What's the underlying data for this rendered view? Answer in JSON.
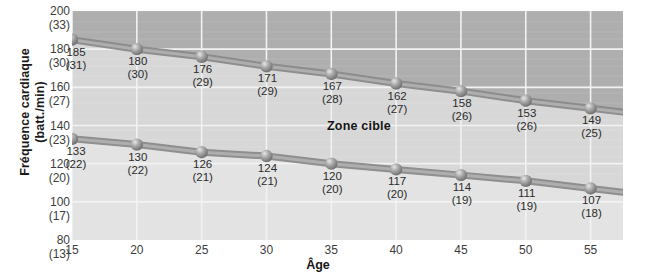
{
  "chart_data": {
    "type": "line",
    "title": "",
    "xlabel": "Âge",
    "ylabel_line1": "Fréquence cardiaque",
    "ylabel_line2": "(batt./min)",
    "x": [
      15,
      20,
      25,
      30,
      35,
      40,
      45,
      50,
      55
    ],
    "xtick_labels": [
      "15",
      "20",
      "25",
      "30",
      "35",
      "40",
      "45",
      "50",
      "55"
    ],
    "xlim": [
      15,
      57.5
    ],
    "ylim": [
      80,
      200
    ],
    "grid": true,
    "legend_position": "none",
    "ytick_values": [
      200,
      180,
      160,
      140,
      120,
      100,
      80
    ],
    "ytick_labels": [
      {
        "main": "200",
        "paren": "(33)"
      },
      {
        "main": "180",
        "paren": "(30)"
      },
      {
        "main": "160",
        "paren": "(27)"
      },
      {
        "main": "140",
        "paren": "(23)"
      },
      {
        "main": "120",
        "paren": "(20)"
      },
      {
        "main": "100",
        "paren": "(17)"
      },
      {
        "main": "80",
        "paren": "(13)"
      }
    ],
    "annotations": [
      {
        "text": "Zone cible",
        "x": 37,
        "y": 148
      }
    ],
    "series": [
      {
        "name": "upper-limit",
        "values": [
          185,
          180,
          176,
          171,
          167,
          162,
          158,
          153,
          149
        ],
        "point_labels": [
          {
            "main": "185",
            "paren": "(31)"
          },
          {
            "main": "180",
            "paren": "(30)"
          },
          {
            "main": "176",
            "paren": "(29)"
          },
          {
            "main": "171",
            "paren": "(29)"
          },
          {
            "main": "167",
            "paren": "(28)"
          },
          {
            "main": "162",
            "paren": "(27)"
          },
          {
            "main": "158",
            "paren": "(26)"
          },
          {
            "main": "153",
            "paren": "(26)"
          },
          {
            "main": "149",
            "paren": "(25)"
          }
        ]
      },
      {
        "name": "lower-limit",
        "values": [
          133,
          130,
          126,
          124,
          120,
          117,
          114,
          111,
          107
        ],
        "point_labels": [
          {
            "main": "133",
            "paren": "(22)"
          },
          {
            "main": "130",
            "paren": "(22)"
          },
          {
            "main": "126",
            "paren": "(21)"
          },
          {
            "main": "124",
            "paren": "(21)"
          },
          {
            "main": "120",
            "paren": "(20)"
          },
          {
            "main": "117",
            "paren": "(20)"
          },
          {
            "main": "114",
            "paren": "(19)"
          },
          {
            "main": "111",
            "paren": "(19)"
          },
          {
            "main": "107",
            "paren": "(18)"
          }
        ]
      }
    ],
    "colors": {
      "band_above": "#aeaeae",
      "band_target": "#d7d7d7",
      "band_below": "#e3e3e3",
      "line": "#9a9a9a",
      "marker": "#8e8e8e",
      "gridline": "#f2f2f2",
      "text": "#2b2b2b"
    }
  }
}
